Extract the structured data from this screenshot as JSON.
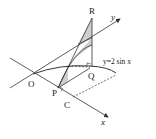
{
  "diagram": {
    "labels": {
      "origin": "O",
      "point_p": "P",
      "point_q": "Q",
      "point_r": "R",
      "point_c": "C",
      "axis_x": "x",
      "axis_y": "y",
      "curve_equation": "y=2 sin x"
    },
    "colors": {
      "stroke": "#333333",
      "shade": "#cfcfcf",
      "background": "#ffffff"
    }
  }
}
